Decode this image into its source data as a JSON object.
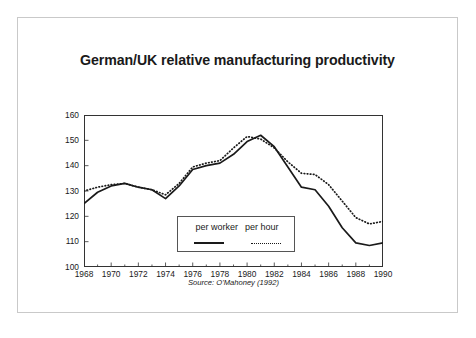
{
  "slide": {
    "title": "German/UK relative manufacturing productivity",
    "source_note": "Source: O'Mahoney (1992)"
  },
  "legend": {
    "entries": [
      {
        "label": "per worker",
        "style": "solid"
      },
      {
        "label": "per hour",
        "style": "dotted"
      }
    ]
  },
  "chart_data": {
    "type": "line",
    "title": "German/UK relative manufacturing productivity",
    "subtitle": "",
    "xlabel": "",
    "ylabel": "",
    "annotations": [
      "Source: O'Mahoney (1992)"
    ],
    "grid": false,
    "legend_position": "inside-bottom-center",
    "xlim": [
      1968,
      1990
    ],
    "ylim": [
      100,
      160
    ],
    "ytick_labels": [
      "100",
      "110",
      "120",
      "130",
      "140",
      "150",
      "160"
    ],
    "yticks": [
      100,
      110,
      120,
      130,
      140,
      150,
      160
    ],
    "xtick_labels": [
      "1968",
      "1970",
      "1972",
      "1974",
      "1976",
      "1978",
      "1980",
      "1982",
      "1984",
      "1986",
      "1988",
      "1990"
    ],
    "xticks": [
      1968,
      1970,
      1972,
      1974,
      1976,
      1978,
      1980,
      1982,
      1984,
      1986,
      1988,
      1990
    ],
    "xtick_minor_every": 1,
    "x": [
      1968,
      1969,
      1970,
      1971,
      1972,
      1973,
      1974,
      1975,
      1976,
      1977,
      1978,
      1979,
      1980,
      1981,
      1982,
      1983,
      1984,
      1985,
      1986,
      1987,
      1988,
      1989,
      1990
    ],
    "series": [
      {
        "name": "per worker",
        "style": "solid",
        "color": "#1a1a1a",
        "values": [
          125.0,
          129.5,
          132.0,
          133.0,
          131.5,
          130.5,
          127.0,
          132.0,
          138.5,
          140.0,
          141.0,
          144.5,
          149.5,
          152.0,
          147.5,
          139.5,
          131.5,
          130.5,
          124.0,
          115.5,
          109.5,
          108.5,
          109.5
        ]
      },
      {
        "name": "per hour",
        "style": "dotted",
        "color": "#1a1a1a",
        "values": [
          130.0,
          131.5,
          132.5,
          133.0,
          131.5,
          130.5,
          128.5,
          133.0,
          139.5,
          141.0,
          142.0,
          147.0,
          151.5,
          150.5,
          147.0,
          141.5,
          137.0,
          136.5,
          132.5,
          126.0,
          119.5,
          117.0,
          118.0
        ]
      }
    ]
  }
}
